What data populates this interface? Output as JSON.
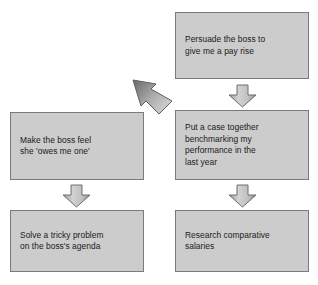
{
  "diagram": {
    "type": "flowchart",
    "background_color": "#ffffff",
    "node_fill_color": "#cccccc",
    "node_border_color": "#7a7a7a",
    "arrow_fill_color": "#b5b5b5",
    "arrow_border_color": "#6e6e6e",
    "text_color": "#1a1a1a",
    "nodes": [
      {
        "id": "persuade",
        "label": "Persuade the boss to\ngive me a pay rise",
        "column": "right",
        "row": 1
      },
      {
        "id": "putcase",
        "label": "Put a case together\nbenchmarking my\nperformance in the\nlast year",
        "column": "right",
        "row": 2
      },
      {
        "id": "research",
        "label": "Research comparative\nsalaries",
        "column": "right",
        "row": 3
      },
      {
        "id": "makeboss",
        "label": "Make the boss feel\nshe 'owes me one'",
        "column": "left",
        "row": 2
      },
      {
        "id": "solve",
        "label": "Solve a tricky problem\non the boss's agenda",
        "column": "left",
        "row": 3
      }
    ],
    "connectors": [
      {
        "id": "persuade-putcase",
        "from": "persuade",
        "to": "putcase",
        "direction": "down",
        "style": "block-arrow"
      },
      {
        "id": "persuade-makeboss",
        "from": "persuade",
        "to": "makeboss",
        "direction": "down-left",
        "style": "large-block-arrow"
      },
      {
        "id": "putcase-research",
        "from": "putcase",
        "to": "research",
        "direction": "down",
        "style": "block-arrow"
      },
      {
        "id": "makeboss-solve",
        "from": "makeboss",
        "to": "solve",
        "direction": "down",
        "style": "block-arrow"
      }
    ]
  }
}
